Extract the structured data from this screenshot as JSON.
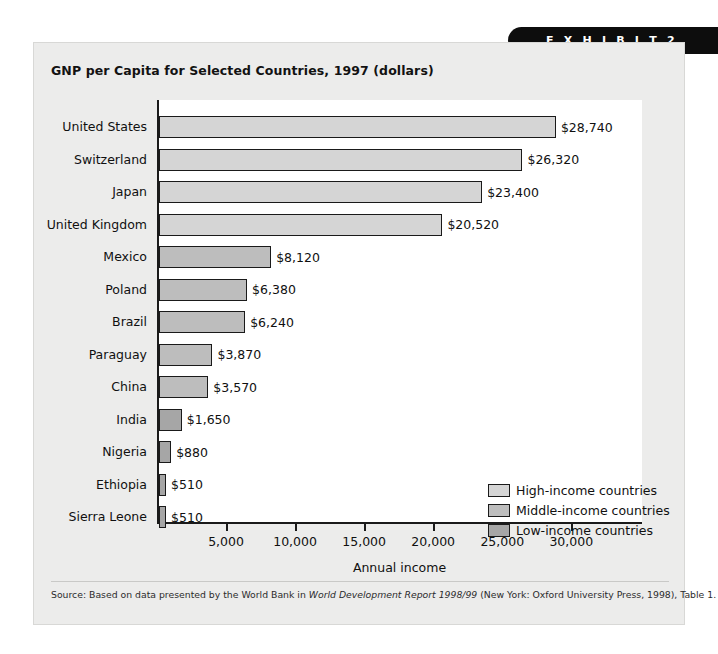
{
  "exhibit": {
    "tab_label": "E X H I B I T   2"
  },
  "chart_data": {
    "type": "bar",
    "orientation": "horizontal",
    "title": "GNP per Capita for Selected Countries, 1997 (dollars)",
    "xlabel": "Annual income",
    "ylabel": "",
    "xlim": [
      0,
      35000
    ],
    "xticks": [
      5000,
      10000,
      15000,
      20000,
      25000,
      30000
    ],
    "xtick_labels": [
      "5,000",
      "10,000",
      "15,000",
      "20,000",
      "25,000",
      "30,000"
    ],
    "grid": false,
    "legend_position": "inside-bottom-right",
    "categories": [
      "United States",
      "Switzerland",
      "Japan",
      "United Kingdom",
      "Mexico",
      "Poland",
      "Brazil",
      "Paraguay",
      "China",
      "India",
      "Nigeria",
      "Ethiopia",
      "Sierra Leone"
    ],
    "values": [
      28740,
      26320,
      23400,
      20520,
      8120,
      6380,
      6240,
      3870,
      3570,
      1650,
      880,
      510,
      510
    ],
    "value_labels": [
      "$28,740",
      "$26,320",
      "$23,400",
      "$20,520",
      "$8,120",
      "$6,380",
      "$6,240",
      "$3,870",
      "$3,570",
      "$1,650",
      "$880",
      "$510",
      "$510"
    ],
    "groups": [
      "high",
      "high",
      "high",
      "high",
      "middle",
      "middle",
      "middle",
      "middle",
      "middle",
      "low",
      "low",
      "low",
      "low"
    ],
    "group_colors": {
      "high": "#d5d5d5",
      "middle": "#bdbdbd",
      "low": "#a6a6a6"
    },
    "legend": [
      {
        "key": "high",
        "label": "High-income countries",
        "color": "#d5d5d5"
      },
      {
        "key": "middle",
        "label": "Middle-income countries",
        "color": "#bdbdbd"
      },
      {
        "key": "low",
        "label": "Low-income countries",
        "color": "#a6a6a6"
      }
    ]
  },
  "source": {
    "prefix": "Source: Based on data presented by the World Bank in ",
    "italic": "World Development Report 1998/99",
    "suffix": " (New York: Oxford University Press, 1998), Table 1."
  }
}
